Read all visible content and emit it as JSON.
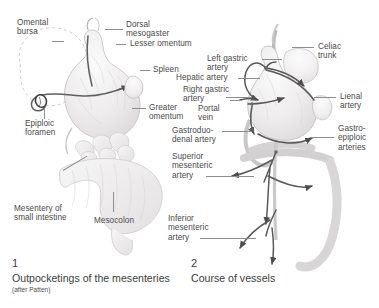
{
  "figure": {
    "background_color": "#ffffff",
    "label_color": "#4a4a4a",
    "leader_color": "#8e8e8e",
    "organ_fill": "#eceaea",
    "organ_stroke": "#bdbbbb",
    "vessel_color": "#595959"
  },
  "panel1": {
    "number": "1",
    "title": "Outpocketings of the mesenteries",
    "subtitle": "(after Patten)",
    "labels": [
      {
        "id": "omental-bursa",
        "text": "Omental\nbursa"
      },
      {
        "id": "dorsal-mesogaster",
        "text": "Dorsal\nmesogaster"
      },
      {
        "id": "lesser-omentum",
        "text": "Lesser omentum"
      },
      {
        "id": "spleen",
        "text": "Spleen"
      },
      {
        "id": "greater-omentum",
        "text": "Greater\nomentum"
      },
      {
        "id": "epiploic-foramen",
        "text": "Epiploic\nforamen"
      },
      {
        "id": "mesentery-small-intestine",
        "text": "Mesentery of\nsmall intestine"
      },
      {
        "id": "mesocolon",
        "text": "Mesocolon"
      }
    ]
  },
  "panel2": {
    "number": "2",
    "title": "Course of vessels",
    "labels": [
      {
        "id": "left-gastric-artery",
        "text": "Left gastric\nartery"
      },
      {
        "id": "celiac-trunk",
        "text": "Celiac\ntrunk"
      },
      {
        "id": "hepatic-artery",
        "text": "Hepatic artery"
      },
      {
        "id": "right-gastric-artery",
        "text": "Right gastric\nartery"
      },
      {
        "id": "portal-vein",
        "text": "Portal\nvein"
      },
      {
        "id": "lienal-artery",
        "text": "Lienal\nartery"
      },
      {
        "id": "gastroduodenal-artery",
        "text": "Gastroduo-\ndenal artery"
      },
      {
        "id": "gastroepiploic-arteries",
        "text": "Gastro-\nepiploic\narteries"
      },
      {
        "id": "superior-mesenteric-artery",
        "text": "Superior\nmesenteric\nartery"
      },
      {
        "id": "inferior-mesenteric-artery",
        "text": "Inferior\nmesenteric\nartery"
      }
    ]
  }
}
